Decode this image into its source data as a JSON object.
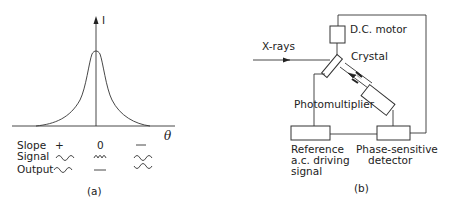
{
  "panel_a": {
    "caption": "(a)",
    "y_axis_label": "I",
    "x_axis_label": "θ",
    "curve": "peaked rocking curve (Lorentzian-like), intensity I vs angle θ, peak centered on axis",
    "table": {
      "rows": [
        {
          "label": "Slope",
          "values": [
            "+",
            "0",
            "—"
          ]
        },
        {
          "label": "Signal",
          "values": [
            "wave-in-phase",
            "wave-double-frequency",
            "wave-in-phase"
          ]
        },
        {
          "label": "Output",
          "values": [
            "wave-positive",
            "flat",
            "wave-inverted"
          ]
        }
      ]
    }
  },
  "panel_b": {
    "caption": "(b)",
    "labels": {
      "xrays": "X-rays",
      "motor": "D.C. motor",
      "crystal": "Crystal",
      "photomultiplier": "Photomultiplier",
      "reference_line1": "Reference",
      "reference_line2": "a.c. driving",
      "reference_line3": "signal",
      "psd_line1": "Phase-sensitive",
      "psd_line2": "detector"
    }
  }
}
